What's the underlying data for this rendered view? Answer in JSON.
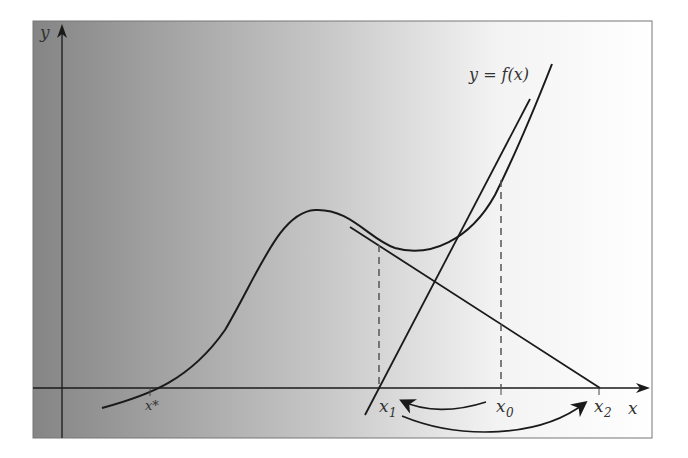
{
  "diagram": {
    "function_label": "y = f(x)",
    "axis_labels": {
      "x": "x",
      "y": "y"
    },
    "point_labels": {
      "root": "x*",
      "x0": "x",
      "x0_sub": "0",
      "x1": "x",
      "x1_sub": "1",
      "x2": "x",
      "x2_sub": "2"
    },
    "colors": {
      "gradient_left": "#8a8a8a",
      "gradient_right": "#ffffff",
      "curve": "#1a1a1a",
      "dashed": "#555555",
      "frame": "#777777"
    }
  }
}
